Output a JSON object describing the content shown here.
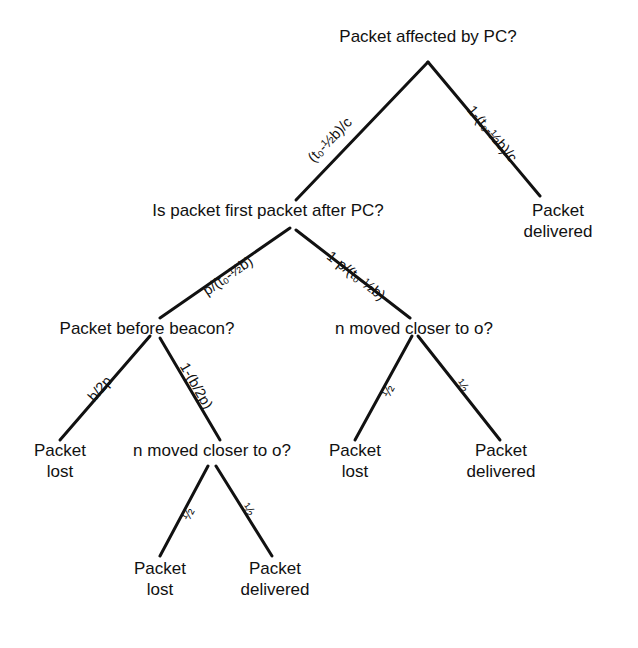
{
  "diagram": {
    "line_color": "#111111",
    "background": "#ffffff",
    "text_color": "#111111"
  },
  "nodes": {
    "root": {
      "line1": "Packet affected by PC?",
      "line2": ""
    },
    "first_after_pc": {
      "line1": "Is packet first packet after PC?",
      "line2": ""
    },
    "delivered_top_right": {
      "line1": "Packet",
      "line2": "delivered"
    },
    "before_beacon": {
      "line1": "Packet before beacon?",
      "line2": ""
    },
    "moved_closer_right": {
      "line1": "n moved closer to o?",
      "line2": ""
    },
    "lost_left": {
      "line1": "Packet",
      "line2": "lost"
    },
    "moved_closer_left": {
      "line1": "n moved closer to o?",
      "line2": ""
    },
    "lost_mid_right": {
      "line1": "Packet",
      "line2": "lost"
    },
    "delivered_mid_right": {
      "line1": "Packet",
      "line2": "delivered"
    },
    "lost_bottom": {
      "line1": "Packet",
      "line2": "lost"
    },
    "delivered_bottom": {
      "line1": "Packet",
      "line2": "delivered"
    }
  },
  "edge_labels": {
    "root_left": "(t₀-½b)/c",
    "root_right": "1-(t₀-½b)/c",
    "first_left": "p/(t₀-½b)",
    "first_right": "1-p/(t₀-½b)",
    "beacon_left": "b/2p",
    "beacon_right": "1-(b/2p)",
    "moved_right_left": "½",
    "moved_right_right": "½",
    "moved_left_left": "½",
    "moved_left_right": "½"
  }
}
